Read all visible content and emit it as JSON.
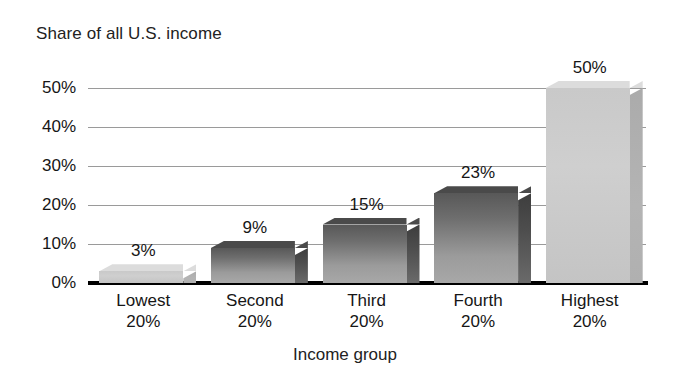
{
  "chart_data": {
    "type": "bar",
    "title": "Share of all U.S. income",
    "xlabel": "Income group",
    "ylabel": "",
    "categories": [
      "Lowest 20%",
      "Second 20%",
      "Third 20%",
      "Fourth 20%",
      "Highest 20%"
    ],
    "category_lines": [
      [
        "Lowest",
        "20%"
      ],
      [
        "Second",
        "20%"
      ],
      [
        "Third",
        "20%"
      ],
      [
        "Fourth",
        "20%"
      ],
      [
        "Highest",
        "20%"
      ]
    ],
    "values": [
      3,
      9,
      15,
      23,
      50
    ],
    "value_labels": [
      "3%",
      "9%",
      "15%",
      "23%",
      "50%"
    ],
    "ylim": [
      0,
      50
    ],
    "ytick_values": [
      0,
      10,
      20,
      30,
      40,
      50
    ],
    "ytick_labels": [
      "0%",
      "10%",
      "20%",
      "30%",
      "40%",
      "50%"
    ],
    "grid": true,
    "legend": "none",
    "bar_styles": [
      "light",
      "dark",
      "dark",
      "dark",
      "light"
    ],
    "colors": {
      "bar_light": "#cfcfcf",
      "bar_dark_top": "#585858",
      "bar_dark_bottom": "#a8a8a8",
      "gridline": "#9a9a9a",
      "axis": "#000000",
      "text": "#161616",
      "background": "#ffffff"
    }
  }
}
